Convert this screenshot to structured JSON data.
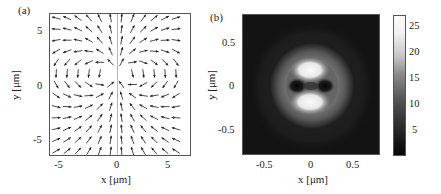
{
  "panels": {
    "a": {
      "label": "(a)",
      "xlabel": "x [μm]",
      "ylabel": "y [μm]",
      "xticks": [
        "-5",
        "0",
        "5"
      ],
      "yticks": [
        "5",
        "0",
        "-5"
      ]
    },
    "b": {
      "label": "(b)",
      "xlabel": "x [μm]",
      "ylabel": "y [μm]",
      "xticks": [
        "-0.5",
        "0",
        "0.5"
      ],
      "yticks": [
        "0.5",
        "0",
        "-0.5"
      ]
    },
    "colorbar": {
      "ticks": [
        "25",
        "20",
        "15",
        "10",
        "5"
      ]
    }
  },
  "chart_data": [
    {
      "type": "quiver",
      "title": "(a)",
      "xlabel": "x [μm]",
      "ylabel": "y [μm]",
      "xlim": [
        -6.5,
        7
      ],
      "ylim": [
        -7,
        7
      ],
      "xticks": [
        -5,
        0,
        5
      ],
      "yticks": [
        -5,
        0,
        5
      ],
      "description": "Dipole-like vector field: arrows emanate upward/outward from a source near (0, 1), curving around both sides and converging back toward the central axis from below (y<0 arrows point down along x=0)."
    },
    {
      "type": "heatmap",
      "title": "(b)",
      "xlabel": "x [μm]",
      "ylabel": "y [μm]",
      "xlim": [
        -0.8,
        0.8
      ],
      "ylim": [
        -0.8,
        0.8
      ],
      "xticks": [
        -0.5,
        0,
        0.5
      ],
      "yticks": [
        -0.5,
        0,
        0.5
      ],
      "colormap": "gray",
      "colorbar": {
        "ticks": [
          5,
          10,
          15,
          20,
          25
        ],
        "range": [
          0,
          27
        ]
      },
      "description": "Intensity pattern: bright lobes (~25) above and below center at y≈±0.15, dark spots at x≈±0.12 y=0, surrounded by a faint ring (~10-12) of radius ≈0.4."
    }
  ]
}
